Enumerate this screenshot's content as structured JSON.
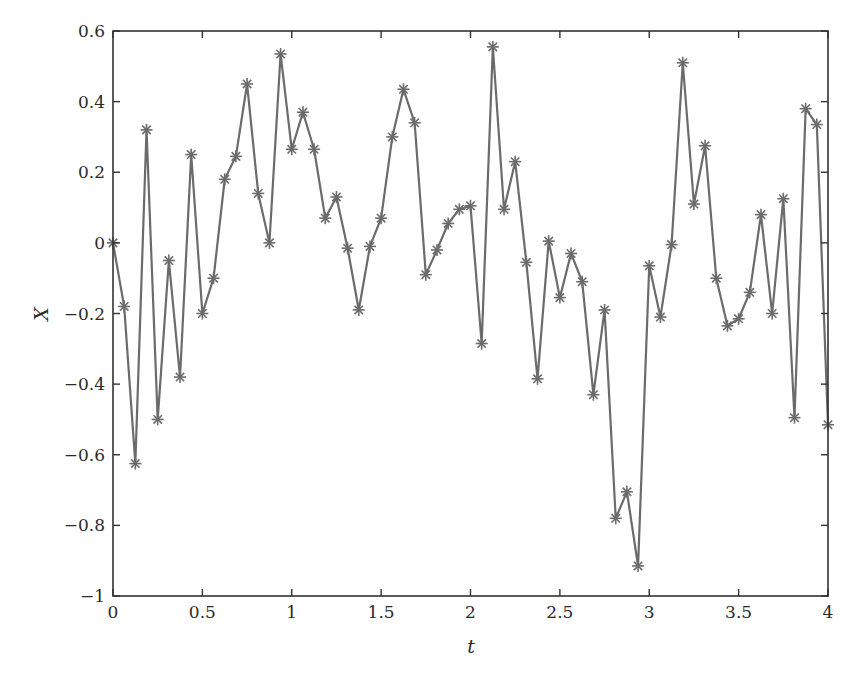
{
  "chart_data": {
    "type": "line",
    "title": "",
    "xlabel": "t",
    "ylabel": "X",
    "xlim": [
      0,
      4
    ],
    "ylim": [
      -1,
      0.6
    ],
    "grid": false,
    "legend": null,
    "marker": "asterisk",
    "line_color": "#6b6b6b",
    "axis_color": "#333333",
    "xticks": [
      0,
      0.5,
      1,
      1.5,
      2,
      2.5,
      3,
      3.5,
      4
    ],
    "xtick_labels": [
      "0",
      "0.5",
      "1",
      "1.5",
      "2",
      "2.5",
      "3",
      "3.5",
      "4"
    ],
    "yticks": [
      -1,
      -0.8,
      -0.6,
      -0.4,
      -0.2,
      0,
      0.2,
      0.4,
      0.6
    ],
    "ytick_labels": [
      "−1",
      "−0.8",
      "−0.6",
      "−0.4",
      "−0.2",
      "0",
      "0.2",
      "0.4",
      "0.6"
    ],
    "series": [
      {
        "name": "X(t)",
        "x": [
          0,
          0.0625,
          0.125,
          0.1875,
          0.25,
          0.3125,
          0.375,
          0.4375,
          0.5,
          0.5625,
          0.625,
          0.6875,
          0.75,
          0.8125,
          0.875,
          0.9375,
          1.0,
          1.0625,
          1.125,
          1.1875,
          1.25,
          1.3125,
          1.375,
          1.4375,
          1.5,
          1.5625,
          1.625,
          1.6875,
          1.75,
          1.8125,
          1.875,
          1.9375,
          2.0,
          2.0625,
          2.125,
          2.1875,
          2.25,
          2.3125,
          2.375,
          2.4375,
          2.5,
          2.5625,
          2.625,
          2.6875,
          2.75,
          2.8125,
          2.875,
          2.9375,
          3.0,
          3.0625,
          3.125,
          3.1875,
          3.25,
          3.3125,
          3.375,
          3.4375,
          3.5,
          3.5625,
          3.625,
          3.6875,
          3.75,
          3.8125,
          3.875,
          3.9375,
          4.0
        ],
        "values": [
          0,
          -0.18,
          -0.625,
          0.32,
          -0.5,
          -0.05,
          -0.38,
          0.25,
          -0.2,
          -0.1,
          0.18,
          0.245,
          0.45,
          0.14,
          0.0,
          0.535,
          0.265,
          0.37,
          0.265,
          0.07,
          0.13,
          -0.015,
          -0.19,
          -0.01,
          0.07,
          0.3,
          0.435,
          0.34,
          -0.09,
          -0.02,
          0.055,
          0.095,
          0.105,
          -0.285,
          0.555,
          0.095,
          0.23,
          -0.055,
          -0.385,
          0.005,
          -0.155,
          -0.03,
          -0.11,
          -0.43,
          -0.19,
          -0.78,
          -0.705,
          -0.915,
          -0.065,
          -0.21,
          -0.005,
          0.51,
          0.11,
          0.275,
          -0.1,
          -0.235,
          -0.215,
          -0.14,
          0.08,
          -0.2,
          0.125,
          -0.495,
          0.38,
          0.335,
          -0.515
        ]
      }
    ]
  }
}
